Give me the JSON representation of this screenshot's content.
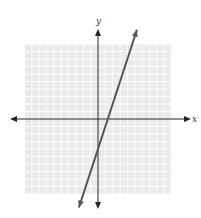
{
  "chart_data": {
    "type": "line",
    "title": "",
    "xlabel": "x",
    "ylabel": "y",
    "xlim": [
      -10,
      10
    ],
    "ylim": [
      -10,
      10
    ],
    "grid": true,
    "grid_step": 1,
    "series": [
      {
        "name": "line",
        "equation": "y = 3x - 4",
        "slope": 3,
        "intercept": -4,
        "x_range": [
          -2.6,
          5.3
        ],
        "color": "#555555"
      }
    ]
  },
  "colors": {
    "grid_background": "#ebebeb",
    "grid_line": "#ffffff",
    "axis": "#222222",
    "line": "#555555"
  }
}
